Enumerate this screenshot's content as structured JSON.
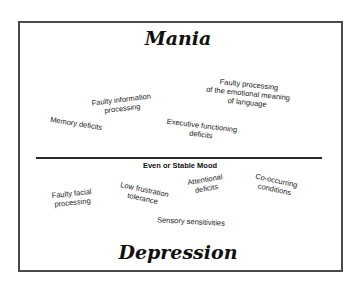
{
  "diagram": {
    "top_title": "Mania",
    "bottom_title": "Depression",
    "divider_label": "Even or Stable Mood",
    "mania_items": [
      {
        "lines": [
          "Faulty information",
          "processing"
        ]
      },
      {
        "lines": [
          "Memory deficits"
        ]
      },
      {
        "lines": [
          "Faulty processing",
          "of the emotional meaning",
          "of language"
        ]
      },
      {
        "lines": [
          "Executive functioning",
          "deficits"
        ]
      }
    ],
    "stable_items": [
      {
        "lines": [
          "Faulty facial",
          "processing"
        ]
      },
      {
        "lines": [
          "Low frustration",
          "tolerance"
        ]
      },
      {
        "lines": [
          "Attentional",
          "deficits"
        ]
      },
      {
        "lines": [
          "Co-occurring",
          "conditions"
        ]
      },
      {
        "lines": [
          "Sensory sensitivities"
        ]
      }
    ]
  },
  "colors": {
    "border": "#4a4a4a",
    "text": "#222222",
    "background": "#ffffff"
  }
}
